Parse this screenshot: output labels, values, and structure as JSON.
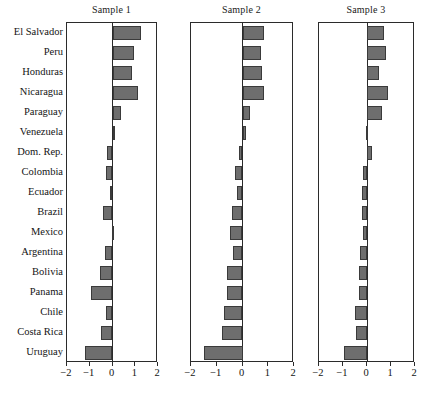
{
  "chart_data": {
    "type": "bar",
    "orientation": "horizontal",
    "title": "",
    "xlabel": "",
    "ylabel": "",
    "xlim": [
      -2,
      2
    ],
    "xticks": [
      -2,
      -1,
      0,
      1,
      2
    ],
    "xtick_labels": [
      "−2",
      "−1",
      "0",
      "1",
      "2"
    ],
    "grid": false,
    "legend": "none",
    "bar_color": "#6e6e6e",
    "bar_edge_color": "#3a3a3a",
    "axis_color": "#2b2b2b",
    "panels": [
      {
        "title": "Sample 1",
        "values": [
          1.25,
          0.95,
          0.85,
          1.1,
          0.38,
          0.08,
          -0.22,
          -0.28,
          -0.1,
          -0.4,
          -0.03,
          -0.32,
          -0.55,
          -0.95,
          -0.3,
          -0.52,
          -1.2
        ]
      },
      {
        "title": "Sample 2",
        "values": [
          0.82,
          0.7,
          0.75,
          0.85,
          0.3,
          0.12,
          -0.12,
          -0.28,
          -0.2,
          -0.42,
          -0.48,
          -0.38,
          -0.6,
          -0.62,
          -0.72,
          -0.8,
          -1.5
        ]
      },
      {
        "title": "Sample 3",
        "values": [
          0.7,
          0.78,
          0.52,
          0.88,
          0.62,
          -0.05,
          0.2,
          -0.18,
          -0.22,
          -0.2,
          -0.18,
          -0.3,
          -0.35,
          -0.32,
          -0.5,
          -0.45,
          -0.95,
          -1.5
        ]
      }
    ],
    "categories": [
      "El Salvador",
      "Peru",
      "Honduras",
      "Nicaragua",
      "Paraguay",
      "Venezuela",
      "Dom. Rep.",
      "Colombia",
      "Ecuador",
      "Brazil",
      "Mexico",
      "Argentina",
      "Bolivia",
      "Panama",
      "Chile",
      "Costa Rica",
      "Uruguay"
    ],
    "series": [
      {
        "name": "Sample 1",
        "values": [
          1.25,
          0.95,
          0.85,
          1.1,
          0.38,
          0.08,
          -0.22,
          -0.28,
          -0.1,
          -0.4,
          -0.03,
          -0.32,
          -0.55,
          -0.95,
          -0.3,
          -0.52,
          -1.2
        ]
      },
      {
        "name": "Sample 2",
        "values": [
          0.82,
          0.7,
          0.75,
          0.85,
          0.3,
          0.12,
          -0.12,
          -0.28,
          -0.2,
          -0.42,
          -0.48,
          -0.38,
          -0.6,
          -0.62,
          -0.72,
          -0.8,
          -1.5
        ]
      },
      {
        "name": "Sample 3",
        "values": [
          0.7,
          0.78,
          0.52,
          0.88,
          0.62,
          -0.05,
          0.2,
          -0.18,
          -0.22,
          -0.2,
          -0.3,
          -0.35,
          -0.32,
          -0.5,
          -0.45,
          -0.95,
          -1.5
        ]
      }
    ]
  },
  "panel_geometry": [
    {
      "left": 66,
      "width": 91
    },
    {
      "left": 190,
      "width": 103
    },
    {
      "left": 318,
      "width": 96
    }
  ]
}
